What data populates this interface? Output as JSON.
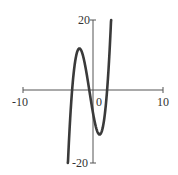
{
  "chart_data": {
    "type": "line",
    "title": "",
    "xlabel": "",
    "ylabel": "",
    "xlim": [
      -10,
      10
    ],
    "ylim": [
      -20,
      20
    ],
    "grid": false,
    "x_tick_labels": [
      "-10",
      "0",
      "10"
    ],
    "y_tick_labels": [
      "20",
      "-20"
    ],
    "series": [
      {
        "name": "f(x)",
        "x": [
          -3.6,
          -3.0,
          -2.5,
          -1.9,
          -1.5,
          -1.0,
          -0.5,
          0.0,
          0.5,
          1.0,
          1.5,
          2.0,
          2.3,
          2.6
        ],
        "values": [
          -20.8,
          0.0,
          10.0,
          12.0,
          11.0,
          6.0,
          0.0,
          -6.0,
          -10.5,
          -12.0,
          -9.0,
          0.0,
          8.1,
          20.8
        ]
      }
    ],
    "color": "#3a3a3a"
  },
  "axes": {
    "x_left": "-10",
    "x_zero": "0",
    "x_right": "10",
    "y_top": "20",
    "y_bottom": "-20"
  }
}
